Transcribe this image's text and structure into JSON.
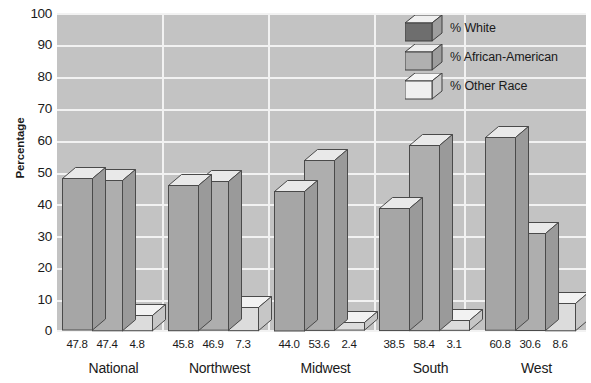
{
  "chart_data": {
    "type": "bar",
    "title": "",
    "subtitle": "",
    "xlabel": "",
    "ylabel": "Percentage",
    "ylim": [
      0,
      100
    ],
    "yticks": [
      100,
      90,
      80,
      70,
      60,
      50,
      40,
      30,
      20,
      10,
      0
    ],
    "grid": "horizontal-and-vertical",
    "legend_position": "top-right",
    "categories": [
      "National",
      "Northwest",
      "Midwest",
      "South",
      "West"
    ],
    "series": [
      {
        "name": "% White",
        "values": [
          47.8,
          45.8,
          44.0,
          38.5,
          60.8
        ]
      },
      {
        "name": "% African-American",
        "values": [
          47.4,
          46.9,
          53.6,
          58.4,
          30.6
        ]
      },
      {
        "name": "% Other Race",
        "values": [
          4.8,
          7.3,
          2.4,
          3.1,
          8.6
        ]
      }
    ],
    "data_labels": [
      [
        "47.8",
        "47.4",
        "4.8"
      ],
      [
        "45.8",
        "46.9",
        "7.3"
      ],
      [
        "44.0",
        "53.6",
        "2.4"
      ],
      [
        "38.5",
        "58.4",
        "3.1"
      ],
      [
        "60.8",
        "30.6",
        "8.6"
      ]
    ]
  },
  "axis": {
    "y_title": "Percentage",
    "y_tick_labels": [
      "100",
      "90",
      "80",
      "70",
      "60",
      "50",
      "40",
      "30",
      "20",
      "10",
      "0"
    ]
  },
  "legend": {
    "items": [
      {
        "label": "% White",
        "swatch": "cube-icon-dark"
      },
      {
        "label": "% African-American",
        "swatch": "cube-icon-medium"
      },
      {
        "label": "% Other Race",
        "swatch": "cube-icon-light"
      }
    ]
  },
  "groups": [
    {
      "name": "National",
      "labels": [
        "47.8",
        "47.4",
        "4.8"
      ]
    },
    {
      "name": "Northwest",
      "labels": [
        "45.8",
        "46.9",
        "7.3"
      ]
    },
    {
      "name": "Midwest",
      "labels": [
        "44.0",
        "53.6",
        "2.4"
      ]
    },
    {
      "name": "South",
      "labels": [
        "38.5",
        "58.4",
        "3.1"
      ]
    },
    {
      "name": "West",
      "labels": [
        "60.8",
        "30.6",
        "8.6"
      ]
    }
  ],
  "colors": {
    "plot_background": "#c3c3c3",
    "gridline": "#f2f2f2",
    "page_background": "#ffffff",
    "bar_front_dark": "#a6a6a6",
    "bar_front_medium": "#aeaeae",
    "bar_front_light": "#dcdcdc",
    "bar_top": "#e9e9e9",
    "bar_side": "#9a9a9a",
    "bar_outline": "#4a4a4a",
    "legend_cube_dark": "#6e6e6e",
    "legend_cube_medium": "#b0b0b0",
    "legend_cube_light": "#f0f0f0",
    "text": "#1a1a1a"
  }
}
